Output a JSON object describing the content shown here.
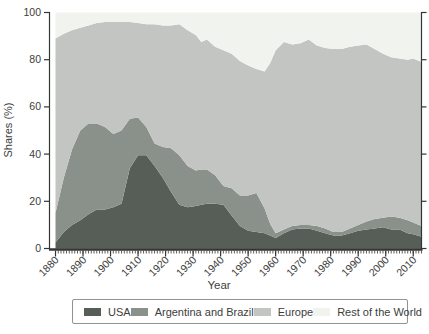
{
  "figure": {
    "kind": "stacked-area-chart",
    "background": "#ffffff"
  },
  "axes": {
    "x_title": "Year",
    "y_title": "Shares (%)",
    "axis_color": "#333633",
    "tick_label_color": "#3c403c"
  },
  "legend": {
    "border_color": "#8f948f",
    "items": [
      "USA",
      "Argentina and Brazil",
      "Europe",
      "Rest of the World"
    ]
  },
  "chart_data": {
    "type": "area",
    "stacked": true,
    "normalized_total": 100,
    "title": "",
    "xlabel": "Year",
    "ylabel": "Shares (%)",
    "xlim": [
      1880,
      2013
    ],
    "ylim": [
      0,
      100
    ],
    "xticks": [
      1880,
      1890,
      1900,
      1910,
      1920,
      1930,
      1940,
      1950,
      1960,
      1970,
      1980,
      1990,
      2000,
      2010
    ],
    "yticks": [
      0,
      20,
      40,
      60,
      80,
      100
    ],
    "grid": false,
    "legend_position": "bottom",
    "x": [
      1880,
      1883,
      1886,
      1889,
      1892,
      1895,
      1898,
      1901,
      1904,
      1907,
      1910,
      1913,
      1916,
      1919,
      1922,
      1925,
      1928,
      1931,
      1933,
      1935,
      1938,
      1941,
      1944,
      1947,
      1950,
      1953,
      1956,
      1958,
      1960,
      1963,
      1966,
      1969,
      1972,
      1975,
      1978,
      1981,
      1984,
      1987,
      1990,
      1993,
      1996,
      1999,
      2002,
      2005,
      2008,
      2010,
      2013
    ],
    "series": [
      {
        "name": "USA",
        "color": "#575d57",
        "values": [
          2.5,
          7,
          10,
          12,
          14.5,
          16.5,
          16.5,
          17.5,
          19,
          34,
          39.5,
          39.5,
          35,
          30,
          24,
          18.5,
          17.5,
          18,
          18.5,
          19,
          19,
          18.5,
          14,
          9.5,
          7.5,
          7,
          6.5,
          5.5,
          4.5,
          6.5,
          8,
          8.5,
          8.5,
          7.5,
          6.5,
          5.5,
          5.5,
          6.5,
          7.5,
          8,
          8.5,
          9,
          8,
          8,
          6.5,
          6,
          5
        ]
      },
      {
        "name": "Argentina and Brazil",
        "color": "#8a908a",
        "values": [
          12.5,
          23,
          32,
          38,
          38.5,
          36.5,
          35,
          31,
          31,
          21,
          16,
          12,
          9.5,
          13,
          18.5,
          21,
          17.5,
          15,
          15,
          14.5,
          12,
          8,
          11.5,
          13,
          15,
          16.5,
          10.5,
          5,
          2,
          1.5,
          1.5,
          1.5,
          1.5,
          2,
          2,
          1.5,
          1.5,
          2,
          2.5,
          3.5,
          4,
          4,
          5.5,
          5,
          5.5,
          5,
          4.5
        ]
      },
      {
        "name": "Europe",
        "color": "#c2c5c1",
        "values": [
          74,
          61,
          50.5,
          43.5,
          41.5,
          42.5,
          44.5,
          47.5,
          46,
          41,
          40,
          43.5,
          50.5,
          51.5,
          52,
          55.5,
          57.5,
          57.5,
          54,
          55,
          54.5,
          57.5,
          57,
          57,
          55,
          52.5,
          58,
          68,
          77.5,
          79.5,
          77,
          77,
          78.5,
          76.5,
          76.5,
          77.5,
          77.5,
          77,
          76,
          75,
          72,
          69.5,
          67.5,
          67.5,
          68,
          69.5,
          69.5
        ]
      },
      {
        "name": "Rest of the World",
        "color": "#f1f3ef",
        "values": [
          11,
          9,
          7.5,
          6.5,
          5.5,
          4.5,
          4,
          4,
          4,
          4,
          4.5,
          5,
          5,
          5.5,
          5.5,
          5,
          7.5,
          9.5,
          12.5,
          11.5,
          14.5,
          16,
          17.5,
          20.5,
          22.5,
          24,
          25,
          21.5,
          16,
          12.5,
          13.5,
          13,
          11.5,
          14,
          15,
          15.5,
          15.5,
          14.5,
          14,
          13.5,
          15.5,
          17.5,
          19,
          19.5,
          20,
          19.5,
          21
        ]
      }
    ]
  }
}
